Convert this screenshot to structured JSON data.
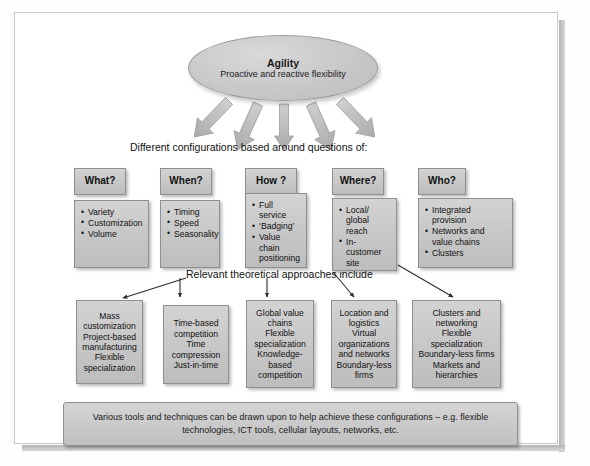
{
  "diagram": {
    "hub": {
      "title": "Agility",
      "subtitle": "Proactive and reactive flexibility"
    },
    "caption_top": "Different configurations based around questions of:",
    "caption_mid": "Relevant theoretical approaches include",
    "questions": [
      {
        "label": "What?",
        "items": [
          "Variety",
          "Customization",
          "Volume"
        ]
      },
      {
        "label": "When?",
        "items": [
          "Timing",
          "Speed",
          "Seasonality"
        ]
      },
      {
        "label": "How ?",
        "items": [
          "Full service",
          "‘Badging’",
          "Value chain positioning"
        ]
      },
      {
        "label": "Where?",
        "items": [
          "Local/ global reach",
          "In-customer site"
        ]
      },
      {
        "label": "Who?",
        "items": [
          "Integrated provision",
          "Networks and value chains",
          "Clusters"
        ]
      }
    ],
    "approaches": [
      {
        "lines": [
          "Mass",
          "customization",
          "Project-based",
          "manufacturing",
          "Flexible",
          "specialization"
        ]
      },
      {
        "lines": [
          "Time-based",
          "competition",
          "Time",
          "compression",
          "Just-in-time"
        ]
      },
      {
        "lines": [
          "Global value",
          "chains",
          "Flexible",
          "specialization",
          "Knowledge-",
          "based",
          "competition"
        ]
      },
      {
        "lines": [
          "Location and",
          "logistics",
          "Virtual",
          "organizations",
          "and networks",
          "Boundary-less",
          "firms"
        ]
      },
      {
        "lines": [
          "Clusters and",
          "networking",
          "Flexible",
          "specialization",
          "Boundary-less firms",
          "Markets and",
          "hierarchies"
        ]
      }
    ],
    "banner": "Various tools and techniques can be drawn upon to help achieve these configurations – e.g. flexible technologies, ICT tools, cellular layouts, networks, etc.",
    "colors": {
      "box_fill": "#c8c8c8",
      "box_border": "#8f8f8f",
      "arrow_thick": "#b5b5b5",
      "arrow_thin": "#2b2b2b",
      "page": "#ffffff"
    }
  }
}
